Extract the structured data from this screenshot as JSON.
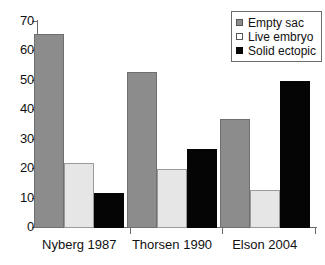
{
  "chart_data": {
    "type": "bar",
    "title": "",
    "subtitle": "",
    "xlabel": "",
    "ylabel": "",
    "categories": [
      "Nyberg 1987",
      "Thorsen 1990",
      "Elson 2004"
    ],
    "series": [
      {
        "name": "Empty sac",
        "color": "#8c8c8c",
        "values": [
          66,
          53,
          37
        ]
      },
      {
        "name": "Live embryo",
        "color": "#e6e6e6",
        "values": [
          22,
          20,
          13
        ]
      },
      {
        "name": "Solid ectopic",
        "color": "#050505",
        "values": [
          12,
          27,
          50
        ]
      }
    ],
    "ylim": [
      0,
      70
    ],
    "ytick_labels": [
      "0",
      "10",
      "20",
      "30",
      "40",
      "50",
      "60",
      "70"
    ],
    "ytick_values": [
      0,
      10,
      20,
      30,
      40,
      50,
      60,
      70
    ],
    "grid": false,
    "legend_position": "top-right",
    "annotations": []
  },
  "legend": {
    "entries": [
      {
        "label": "Empty sac",
        "swatch": "legend-swatch-empty-sac"
      },
      {
        "label": "Live embryo",
        "swatch": "legend-swatch-live-embryo"
      },
      {
        "label": "Solid ectopic",
        "swatch": "legend-swatch-solid-ectopic"
      }
    ]
  }
}
